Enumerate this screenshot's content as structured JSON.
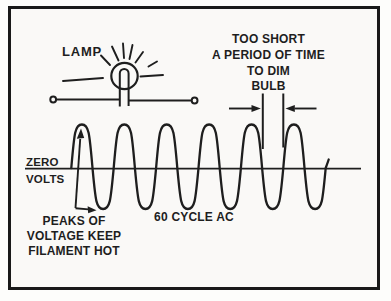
{
  "labels": {
    "lamp": "LAMP",
    "marker": {
      "line1": "TOO SHORT",
      "line2": "A PERIOD OF TIME",
      "line3": "TO DIM",
      "line4": "BULB"
    },
    "axis": {
      "line1": "ZERO",
      "line2": "VOLTS"
    },
    "peaks": {
      "line1": "PEAKS OF",
      "line2": "VOLTAGE KEEP",
      "line3": "FILAMENT HOT"
    },
    "wave_label": "60 CYCLE AC"
  },
  "wave": {
    "cycles": 6,
    "x0": 71.3,
    "period": 42.4,
    "axis_y": 168,
    "peak_y": 124.5,
    "trough_y": 209
  },
  "colors": {
    "ink": "#1e1e1e",
    "border": "#191919",
    "paper": "#faf9f7"
  }
}
